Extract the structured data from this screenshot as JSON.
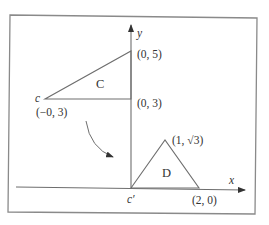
{
  "diagram": {
    "colors": {
      "frame": "#8a8a8a",
      "line": "#6e6e6e",
      "text": "#333333",
      "background": "#ffffff"
    },
    "axes": {
      "x_label": "x",
      "y_label": "y"
    },
    "triangle_C": {
      "name": "C",
      "vertices": [
        {
          "label": "(0, 5)"
        },
        {
          "label": "(0, 3)"
        },
        {
          "label": "(−0, 3)",
          "point_name": "c"
        }
      ]
    },
    "triangle_D": {
      "name": "D",
      "vertices": [
        {
          "label": "(1, √3)"
        },
        {
          "label": "(2, 0)"
        },
        {
          "label": "",
          "point_name": "c′"
        }
      ]
    },
    "transform_arrow": {
      "icon": "curved-arrow-icon",
      "meaning": "maps triangle C to triangle D"
    }
  }
}
